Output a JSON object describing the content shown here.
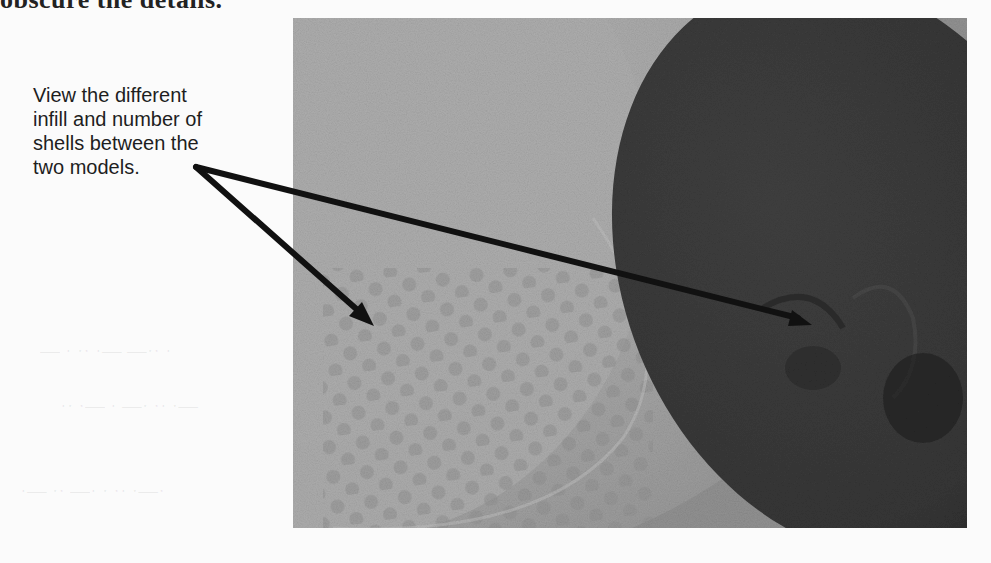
{
  "document": {
    "top_line_fragment": "obscure the details.",
    "callout": {
      "lines": [
        "View the different",
        "infill and number of",
        "shells between the",
        "two models."
      ]
    },
    "figure": {
      "description": "Photo comparing two 3D printed models: a light-colored model with honeycomb infill (left) and a dark model with sparse infill and shells (right)",
      "arrow_targets": [
        "left model infill",
        "right model infill"
      ]
    }
  },
  "colors": {
    "text": "#1e1e1e",
    "arrow": "#111111",
    "light_model": "#b2b2b2",
    "dark_model": "#3a3a3a",
    "photo_background": "#8e8e8e",
    "page": "#fbfbfb"
  }
}
